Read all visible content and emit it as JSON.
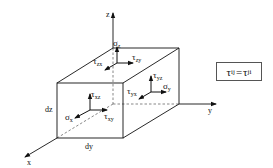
{
  "diagram": {
    "axes": {
      "x": "x",
      "y": "y",
      "z": "z"
    },
    "dimensions": {
      "dy": "dy",
      "dz": "dz"
    },
    "top_face": {
      "normal": {
        "symbol": "σ",
        "sub": "z"
      },
      "shear_1": {
        "symbol": "τ",
        "sub": "zx"
      },
      "shear_2": {
        "symbol": "τ",
        "sub": "zy"
      }
    },
    "front_face": {
      "normal": {
        "symbol": "σ",
        "sub": "x"
      },
      "shear_1": {
        "symbol": "τ",
        "sub": "xz"
      },
      "shear_2": {
        "symbol": "τ",
        "sub": "xy"
      }
    },
    "right_face": {
      "normal": {
        "symbol": "σ",
        "sub": "y"
      },
      "shear_1": {
        "symbol": "τ",
        "sub": "yz"
      },
      "shear_2": {
        "symbol": "τ",
        "sub": "yx"
      }
    },
    "equation": {
      "lhs_symbol": "τ",
      "lhs_sub": "ij",
      "operator": "=",
      "rhs_symbol": "τ",
      "rhs_sub": "ji"
    },
    "colors": {
      "line": "#111111",
      "dashed": "#555555",
      "background": "#ffffff"
    }
  }
}
